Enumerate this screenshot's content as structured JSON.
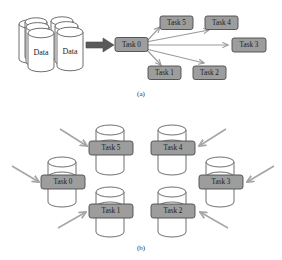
{
  "figure": {
    "background_color": "#ffffff",
    "task_box_fill": "#9d9d9d",
    "task_box_border": "#4a4a4a",
    "arrow_color": "#9a9a9a",
    "block_arrow_color": "#5a5a5a",
    "cylinder_stroke": "#5f5f5f"
  },
  "panel_a": {
    "caption": "(a)",
    "data_store": {
      "labels": [
        "Data",
        "Data"
      ],
      "cylinder_count": 6
    },
    "source_task": {
      "label": "Task 0"
    },
    "target_tasks": [
      {
        "label": "Task 5"
      },
      {
        "label": "Task 4"
      },
      {
        "label": "Task 3"
      },
      {
        "label": "Task 1"
      },
      {
        "label": "Task 2"
      }
    ],
    "edges": [
      {
        "from": "Task 0",
        "to": "Task 5"
      },
      {
        "from": "Task 0",
        "to": "Task 4"
      },
      {
        "from": "Task 0",
        "to": "Task 3"
      },
      {
        "from": "Task 0",
        "to": "Task 1"
      },
      {
        "from": "Task 0",
        "to": "Task 2"
      }
    ],
    "block_arrow": {
      "from": "Data",
      "to": "Task 0"
    }
  },
  "panel_b": {
    "caption": "(b)",
    "nodes": [
      {
        "label": "Task 5",
        "incoming_arrow_from": "upper-left"
      },
      {
        "label": "Task 4",
        "incoming_arrow_from": "upper-right"
      },
      {
        "label": "Task 0",
        "incoming_arrow_from": "left"
      },
      {
        "label": "Task 3",
        "incoming_arrow_from": "right"
      },
      {
        "label": "Task 1",
        "incoming_arrow_from": "lower-left"
      },
      {
        "label": "Task 2",
        "incoming_arrow_from": "lower-right"
      }
    ]
  }
}
